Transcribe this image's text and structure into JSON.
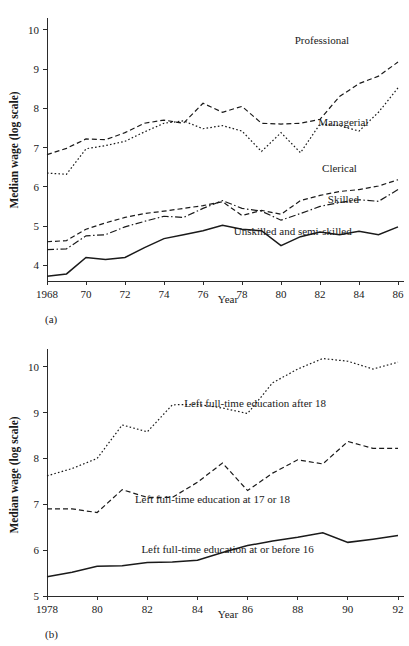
{
  "figure": {
    "background": "#ffffff",
    "ink": "#1a1a1a"
  },
  "panel_a": {
    "caption": "(a)",
    "ylabel": "Median wage (log scale)",
    "xlabel": "Year"
  },
  "panel_b": {
    "caption": "(b)",
    "ylabel": "Median wage (log scale)",
    "xlabel": "Year"
  },
  "chart_data": [
    {
      "type": "line",
      "id": "panel-a",
      "title": "",
      "caption": "(a)",
      "xlabel": "Year",
      "ylabel": "Median wage (log scale)",
      "xlim": [
        1968,
        1986
      ],
      "ylim": [
        3.6,
        10.2
      ],
      "yticks": [
        4,
        5,
        6,
        7,
        8,
        9,
        10
      ],
      "ytick_labels": [
        "4",
        "5",
        "6",
        "7",
        "8",
        "9",
        "10"
      ],
      "xticks": [
        1968,
        1970,
        1972,
        1974,
        1976,
        1978,
        1980,
        1982,
        1984,
        1986
      ],
      "xtick_labels": [
        "1968",
        "70",
        "72",
        "74",
        "76",
        "78",
        "80",
        "82",
        "84",
        "86"
      ],
      "grid": false,
      "legend": "inline-labels",
      "x": [
        1968,
        1969,
        1970,
        1971,
        1972,
        1973,
        1974,
        1975,
        1976,
        1977,
        1978,
        1979,
        1980,
        1981,
        1982,
        1983,
        1984,
        1985,
        1986
      ],
      "series": [
        {
          "name": "Professional",
          "style": "dashed",
          "label_x": 1982.1,
          "label_y": 9.63,
          "values": [
            6.82,
            6.98,
            7.22,
            7.2,
            7.38,
            7.62,
            7.7,
            7.62,
            8.13,
            7.9,
            8.05,
            7.62,
            7.6,
            7.62,
            7.72,
            8.3,
            8.63,
            8.82,
            9.18
          ]
        },
        {
          "name": "Managerial",
          "style": "dotted",
          "label_x": 1983.2,
          "label_y": 7.54,
          "values": [
            6.35,
            6.32,
            6.97,
            7.05,
            7.16,
            7.4,
            7.62,
            7.68,
            7.48,
            7.56,
            7.42,
            6.9,
            7.38,
            6.87,
            7.6,
            7.56,
            7.42,
            7.9,
            8.52
          ]
        },
        {
          "name": "Clerical",
          "style": "dashed",
          "label_x": 1983.0,
          "label_y": 6.38,
          "values": [
            4.6,
            4.63,
            4.92,
            5.08,
            5.22,
            5.32,
            5.38,
            5.45,
            5.52,
            5.62,
            5.27,
            5.4,
            5.3,
            5.65,
            5.78,
            5.88,
            5.93,
            6.02,
            6.18
          ]
        },
        {
          "name": "Skilled",
          "style": "dashdot",
          "label_x": 1983.2,
          "label_y": 5.58,
          "values": [
            4.4,
            4.42,
            4.75,
            4.78,
            4.98,
            5.12,
            5.25,
            5.22,
            5.45,
            5.65,
            5.45,
            5.38,
            5.15,
            5.32,
            5.5,
            5.6,
            5.67,
            5.63,
            5.93
          ]
        },
        {
          "name": "Unskilled and semi-skilled",
          "style": "solid",
          "label_x": 1980.6,
          "label_y": 4.76,
          "values": [
            3.72,
            3.78,
            4.2,
            4.15,
            4.2,
            4.45,
            4.68,
            4.78,
            4.88,
            5.02,
            4.92,
            4.88,
            4.5,
            4.73,
            4.85,
            4.78,
            4.87,
            4.78,
            4.98
          ]
        }
      ]
    },
    {
      "type": "line",
      "id": "panel-b",
      "title": "",
      "caption": "(b)",
      "xlabel": "Year",
      "ylabel": "Median wage (log scale)",
      "xlim": [
        1978,
        1992
      ],
      "ylim": [
        5.0,
        10.3
      ],
      "yticks": [
        5,
        6,
        7,
        8,
        9,
        10
      ],
      "ytick_labels": [
        "5",
        "6",
        "7",
        "8",
        "9",
        "10"
      ],
      "xticks": [
        1978,
        1980,
        1982,
        1984,
        1986,
        1988,
        1990,
        1992
      ],
      "xtick_labels": [
        "1978",
        "80",
        "82",
        "84",
        "86",
        "88",
        "90",
        "92"
      ],
      "grid": false,
      "legend": "inline-labels",
      "x": [
        1978,
        1979,
        1980,
        1981,
        1982,
        1983,
        1984,
        1985,
        1986,
        1987,
        1988,
        1989,
        1990,
        1991,
        1992
      ],
      "series": [
        {
          "name": "Left full-time education after 18",
          "style": "dotted",
          "label_x": 1986.3,
          "label_y": 9.12,
          "values": [
            7.62,
            7.78,
            8.0,
            8.73,
            8.58,
            9.17,
            9.18,
            9.1,
            8.98,
            9.65,
            9.95,
            10.18,
            10.12,
            9.95,
            10.1
          ]
        },
        {
          "name": "Left full-time education at 17 or 18",
          "style": "dashed",
          "label_x": 1984.6,
          "label_y": 7.03,
          "values": [
            6.9,
            6.9,
            6.82,
            7.32,
            7.15,
            7.15,
            7.48,
            7.9,
            7.3,
            7.68,
            7.97,
            7.88,
            8.37,
            8.22,
            8.22
          ]
        },
        {
          "name": "Left full-time education at or before 16",
          "style": "solid",
          "label_x": 1985.2,
          "label_y": 5.93,
          "values": [
            5.42,
            5.52,
            5.65,
            5.66,
            5.73,
            5.74,
            5.78,
            5.95,
            6.1,
            6.2,
            6.28,
            6.38,
            6.17,
            6.24,
            6.32
          ]
        }
      ]
    }
  ]
}
